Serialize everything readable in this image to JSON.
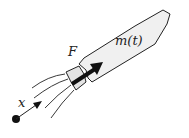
{
  "diagram": {
    "labels": {
      "mass": "m(t)",
      "force": "F",
      "position": "x"
    },
    "colors": {
      "body_fill": "#f0f0f0",
      "stroke": "#222222",
      "force_arrow": "#111111",
      "background": "#ffffff"
    },
    "exhaust_lines": 4
  }
}
